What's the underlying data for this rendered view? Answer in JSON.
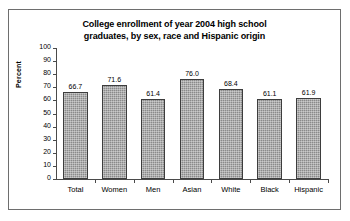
{
  "chart_data": {
    "type": "bar",
    "title": "College enrollment of year 2004 high school graduates, by sex, race and Hispanic origin",
    "title_lines": [
      "College enrollment of year 2004 high school",
      "graduates, by sex, race and Hispanic origin"
    ],
    "xlabel": "",
    "ylabel": "Percent",
    "ylim": [
      0,
      100
    ],
    "ytick_step": 10,
    "yticks": [
      100,
      90,
      80,
      70,
      60,
      50,
      40,
      30,
      20,
      10,
      0
    ],
    "ytick_labels": [
      "100",
      "90",
      "80",
      "70",
      "60",
      "50",
      "40",
      "30",
      "20",
      "10",
      "0"
    ],
    "grid": false,
    "legend": false,
    "categories": [
      "Total",
      "Women",
      "Men",
      "Asian",
      "White",
      "Black",
      "Hispanic"
    ],
    "values": [
      66.7,
      71.6,
      61.4,
      76.0,
      68.4,
      61.1,
      61.9
    ],
    "value_labels": [
      "66.7",
      "71.6",
      "61.4",
      "76.0",
      "68.4",
      "61.1",
      "61.9"
    ],
    "bar_color": "#8a8a8a",
    "bar_border_color": "#3d3d3d",
    "axis_color": "#4a4a4a",
    "frame_color": "#6e6e6e",
    "text_color": "#000000"
  }
}
